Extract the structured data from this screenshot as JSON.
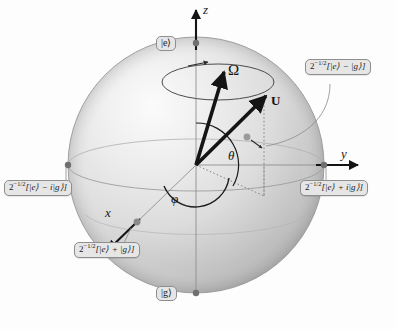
{
  "figure": {
    "type": "bloch-sphere-diagram",
    "background_color": "#fdfdfd",
    "sphere": {
      "center_x": 196,
      "center_y": 165,
      "radius": 128,
      "fill_light": "#f2f2f2",
      "fill_mid": "#d8d8d8",
      "fill_dark": "#a8a8a8",
      "edge_color": "#9a9a9a"
    }
  },
  "axes": [
    {
      "name": "z",
      "label": "z",
      "direction": "up",
      "pole_label": "excited"
    },
    {
      "name": "y",
      "label": "y",
      "direction": "right",
      "pole_label": "plus-i"
    },
    {
      "name": "x",
      "label": "x",
      "direction": "down-left",
      "pole_label": "plus"
    }
  ],
  "vectors": [
    {
      "name": "omega",
      "label": "Ω",
      "description": "Rabi drive vector",
      "color": "#1a1a1a"
    },
    {
      "name": "u",
      "label": "U",
      "description": "Bloch vector of the atomic state",
      "color": "#1a1a1a",
      "bold": true
    }
  ],
  "angles": [
    {
      "name": "theta",
      "label": "θ",
      "description": "polar angle from z axis"
    },
    {
      "name": "phi",
      "label": "φ",
      "description": "azimuthal angle in xy plane"
    }
  ],
  "pole_labels": {
    "north": "|e⟩",
    "south": "|g⟩"
  },
  "state_labels": [
    {
      "id": "e-minus-g",
      "position": "top-right",
      "prefix": "2",
      "exponent": "−1/2",
      "expression": "[|e⟩ − |g⟩]",
      "full_text": "2^−1/2 [|e⟩ − |g⟩]",
      "points_to": "minus-x pole on far side of sphere"
    },
    {
      "id": "e-minus-ig",
      "position": "left",
      "prefix": "2",
      "exponent": "−1/2",
      "expression": "[|e⟩ − i|g⟩]",
      "full_text": "2^−1/2 [|e⟩ − i|g⟩]",
      "points_to": "minus-y pole"
    },
    {
      "id": "e-plus-ig",
      "position": "right",
      "prefix": "2",
      "exponent": "−1/2",
      "expression": "[|e⟩ + i|g⟩]",
      "full_text": "2^−1/2 [|e⟩ + i|g⟩]",
      "points_to": "plus-y pole"
    },
    {
      "id": "e-plus-g",
      "position": "bottom-left",
      "prefix": "2",
      "exponent": "−1/2",
      "expression": "[|e⟩ + |g⟩]",
      "full_text": "2^−1/2 [|e⟩ + |g⟩]",
      "points_to": "plus-x pole"
    }
  ],
  "annotations": {
    "precession_circle": "dashed-free ellipse around z axis with arrowhead showing precession direction",
    "projection_lines": "dotted lines projecting U onto the xy plane and the z axis",
    "far_pole_marker": "small gray dot with short arrow on far side of sphere"
  }
}
